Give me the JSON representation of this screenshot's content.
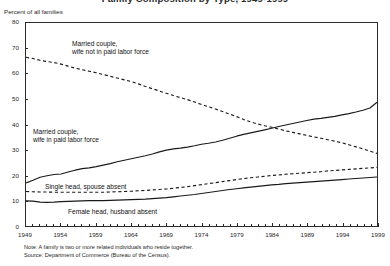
{
  "chart_title": "Family Composition by Type, 1949-1999",
  "y_axis_caption": "Percent of all families",
  "footnotes": {
    "note": "Note: A family is two or more related individuals who reside together.",
    "source": "Source: Department of Commerce (Bureau of the Census)."
  },
  "series_labels": {
    "married_wife_not_in_lf_line1": "Married couple,",
    "married_wife_not_in_lf_line2": "wife not in paid labor force",
    "married_wife_in_lf_line1": "Married couple,",
    "married_wife_in_lf_line2": "wife in paid labor force",
    "single_head": "Single head, spouse absent",
    "female_head": "Female head, husband absent"
  },
  "chart_data": {
    "type": "line",
    "title": "Family Composition by Type, 1949-1999",
    "xlabel": "",
    "ylabel": "Percent of all families",
    "xlim": [
      1949,
      1999
    ],
    "ylim": [
      0,
      80
    ],
    "grid": false,
    "legend": "inline-annotations",
    "ytick_labels": [
      "0",
      "10",
      "20",
      "30",
      "40",
      "50",
      "60",
      "70",
      "80"
    ],
    "ytick_values": [
      0,
      10,
      20,
      30,
      40,
      50,
      60,
      70,
      80
    ],
    "xtick_labels": [
      "1949",
      "1954",
      "1959",
      "1964",
      "1969",
      "1974",
      "1979",
      "1984",
      "1989",
      "1994",
      "1999"
    ],
    "xtick_values": [
      1949,
      1954,
      1959,
      1964,
      1969,
      1974,
      1979,
      1984,
      1989,
      1994,
      1999
    ],
    "x": [
      1949,
      1950,
      1951,
      1952,
      1953,
      1954,
      1955,
      1956,
      1957,
      1958,
      1959,
      1960,
      1961,
      1962,
      1963,
      1964,
      1965,
      1966,
      1967,
      1968,
      1969,
      1970,
      1971,
      1972,
      1973,
      1974,
      1975,
      1976,
      1977,
      1978,
      1979,
      1980,
      1981,
      1982,
      1983,
      1984,
      1985,
      1986,
      1987,
      1988,
      1989,
      1990,
      1991,
      1992,
      1993,
      1994,
      1995,
      1996,
      1997,
      1998,
      1999
    ],
    "series": [
      {
        "name": "Married couple, wife not in paid labor force",
        "style": "dashed",
        "color": "#1a1a1a",
        "values": [
          66.5,
          66.0,
          65.3,
          64.8,
          64.4,
          63.8,
          63.0,
          62.2,
          61.6,
          61.0,
          60.4,
          59.7,
          59.0,
          58.3,
          57.6,
          56.9,
          56.0,
          55.0,
          54.1,
          53.2,
          52.3,
          51.4,
          50.6,
          49.8,
          48.9,
          47.9,
          47.0,
          46.1,
          45.1,
          44.1,
          43.1,
          42.0,
          41.0,
          40.2,
          39.5,
          38.9,
          38.2,
          37.5,
          36.9,
          36.3,
          35.7,
          35.1,
          34.6,
          34.0,
          33.4,
          32.8,
          32.0,
          31.2,
          30.4,
          29.5,
          28.6
        ]
      },
      {
        "name": "Married couple, wife in paid labor force",
        "style": "solid",
        "color": "#1a1a1a",
        "values": [
          17.0,
          18.0,
          19.2,
          19.8,
          20.3,
          20.5,
          21.3,
          22.0,
          22.6,
          22.9,
          23.4,
          24.0,
          24.6,
          25.3,
          25.9,
          26.5,
          27.1,
          27.7,
          28.4,
          29.2,
          29.9,
          30.4,
          30.7,
          31.1,
          31.6,
          32.2,
          32.6,
          33.1,
          33.8,
          34.6,
          35.4,
          36.1,
          36.7,
          37.3,
          37.9,
          38.5,
          39.2,
          39.8,
          40.4,
          41.0,
          41.6,
          42.1,
          42.4,
          42.8,
          43.2,
          43.8,
          44.3,
          44.9,
          45.6,
          46.5,
          48.8
        ]
      },
      {
        "name": "Single head, spouse absent",
        "style": "dashed",
        "color": "#1a1a1a",
        "values": [
          13.6,
          13.5,
          13.4,
          13.4,
          13.3,
          13.3,
          13.3,
          13.3,
          13.3,
          13.3,
          13.3,
          13.3,
          13.4,
          13.5,
          13.6,
          13.7,
          13.9,
          14.0,
          14.2,
          14.4,
          14.6,
          14.9,
          15.2,
          15.5,
          15.9,
          16.3,
          16.7,
          17.1,
          17.5,
          17.9,
          18.3,
          18.7,
          19.0,
          19.3,
          19.6,
          19.9,
          20.1,
          20.4,
          20.6,
          20.8,
          21.0,
          21.2,
          21.4,
          21.7,
          21.9,
          22.1,
          22.3,
          22.5,
          22.7,
          22.9,
          23.1
        ]
      },
      {
        "name": "Female head, husband absent",
        "style": "solid",
        "color": "#1a1a1a",
        "values": [
          9.9,
          9.8,
          9.4,
          9.3,
          9.4,
          9.6,
          9.7,
          9.8,
          9.9,
          10.0,
          10.0,
          10.0,
          10.1,
          10.2,
          10.3,
          10.4,
          10.5,
          10.6,
          10.8,
          11.0,
          11.2,
          11.5,
          11.8,
          12.1,
          12.4,
          12.8,
          13.2,
          13.6,
          14.0,
          14.4,
          14.7,
          15.0,
          15.3,
          15.6,
          15.9,
          16.2,
          16.4,
          16.7,
          16.9,
          17.1,
          17.3,
          17.5,
          17.7,
          17.9,
          18.1,
          18.3,
          18.5,
          18.7,
          18.9,
          19.1,
          19.3
        ]
      }
    ]
  }
}
